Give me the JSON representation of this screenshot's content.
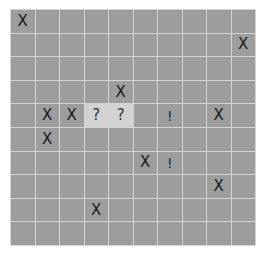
{
  "title": "",
  "board": {
    "rows": 10,
    "cols": 10,
    "colors": {
      "hidden": "#9d9d9d",
      "revealed": "#d2d2d2",
      "gridline": "#d4d4d4"
    },
    "cells": [
      [
        "X",
        "",
        "",
        "",
        "",
        "",
        "",
        "",
        "",
        ""
      ],
      [
        "",
        "",
        "",
        "",
        "",
        "",
        "",
        "",
        "",
        "X"
      ],
      [
        "",
        "",
        "",
        "",
        "",
        "",
        "",
        "",
        "",
        ""
      ],
      [
        "",
        "",
        "",
        "",
        "X",
        "",
        "",
        "",
        "",
        ""
      ],
      [
        "",
        "X",
        "X",
        "?",
        "?",
        "",
        "!",
        "",
        "X",
        ""
      ],
      [
        "",
        "X",
        "",
        "",
        "",
        "",
        "",
        "",
        "",
        ""
      ],
      [
        "",
        "",
        "",
        "",
        "",
        "X",
        "!",
        "",
        "",
        ""
      ],
      [
        "",
        "",
        "",
        "",
        "",
        "",
        "",
        "",
        "X",
        ""
      ],
      [
        "",
        "",
        "",
        "X",
        "",
        "",
        "",
        "",
        "",
        ""
      ],
      [
        "",
        "",
        "",
        "",
        "",
        "",
        "",
        "",
        "",
        ""
      ]
    ],
    "revealed": [
      [
        4,
        3
      ],
      [
        4,
        4
      ]
    ]
  }
}
